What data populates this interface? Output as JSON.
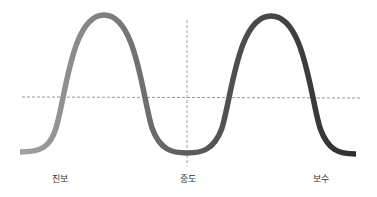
{
  "diagram": {
    "title": "",
    "labels": {
      "left": "진보",
      "center": "중도",
      "right": "보수"
    },
    "colors": {
      "curve_start": "#a0a0a0",
      "curve_mid": "#5a5a5a",
      "curve_end": "#2e2e2e",
      "dashed_line": "#777777",
      "label_text": "#333333",
      "background": "#ffffff"
    },
    "curve": {
      "shape": "bimodal distribution",
      "peaks": [
        {
          "x": 104,
          "y": 15
        },
        {
          "x": 271,
          "y": 16
        }
      ],
      "trough": {
        "x": 187,
        "y": 153
      },
      "endpoints": [
        {
          "x": 20,
          "y": 152
        },
        {
          "x": 356,
          "y": 154
        }
      ]
    },
    "reference_lines": {
      "horizontal_y": 97,
      "vertical_x": 187
    }
  }
}
